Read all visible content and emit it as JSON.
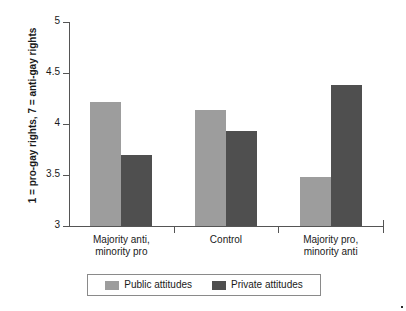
{
  "chart_data": {
    "type": "bar",
    "title": "",
    "subtitle": "",
    "xlabel": "",
    "ylabel": "1 = pro-gay rights, 7 = anti-gay rights",
    "categories": [
      "Majority anti, minority pro",
      "Control",
      "Majority pro, minority anti"
    ],
    "category_lines": [
      [
        "Majority anti,",
        "minority pro"
      ],
      [
        "Control"
      ],
      [
        "Majority pro,",
        "minority anti"
      ]
    ],
    "series": [
      {
        "name": "Public attitudes",
        "color": "#9d9d9d",
        "values": [
          4.22,
          4.14,
          3.48
        ]
      },
      {
        "name": "Private attitudes",
        "color": "#4f4f4f",
        "values": [
          3.7,
          3.93,
          4.38
        ]
      }
    ],
    "ylim": [
      3,
      5
    ],
    "yticks": [
      3,
      3.5,
      4,
      4.5,
      5
    ],
    "ytick_labels": [
      "3",
      "3.5",
      "4",
      "4.5",
      "5"
    ],
    "grid": false,
    "legend_position": "bottom"
  },
  "axis": {
    "y_title": "1 = pro-gay rights, 7 = anti-gay rights",
    "ticks": [
      {
        "value": 5,
        "label": "5"
      },
      {
        "value": 4.5,
        "label": "4.5"
      },
      {
        "value": 4,
        "label": "4"
      },
      {
        "value": 3.5,
        "label": "3.5"
      },
      {
        "value": 3,
        "label": "3"
      }
    ]
  },
  "groups": [
    {
      "line1": "Majority anti,",
      "line2": "minority pro"
    },
    {
      "line1": "Control",
      "line2": ""
    },
    {
      "line1": "Majority pro,",
      "line2": "minority anti"
    }
  ],
  "legend": {
    "items": [
      {
        "label": "Public attitudes",
        "color": "#9d9d9d"
      },
      {
        "label": "Private attitudes",
        "color": "#4f4f4f"
      }
    ]
  }
}
